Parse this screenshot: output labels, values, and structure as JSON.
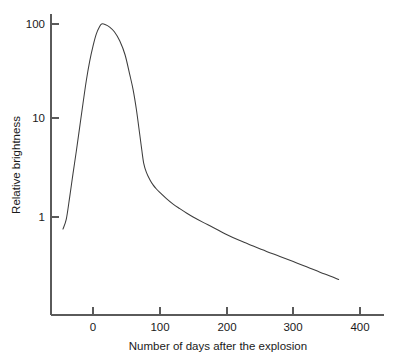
{
  "chart_data": {
    "type": "line",
    "title": "",
    "xlabel": "Number of days after the explosion",
    "ylabel": "Relative brightness",
    "xscale": "linear",
    "yscale": "log",
    "xlim": [
      -55,
      435
    ],
    "ylim": [
      0.17,
      180
    ],
    "grid": false,
    "legend": false,
    "xticks": [
      0,
      100,
      200,
      300,
      400
    ],
    "xticklabels": [
      "0",
      "100",
      "200",
      "300",
      "400"
    ],
    "yticks": [
      1,
      10,
      100
    ],
    "yticklabels": [
      "1",
      "10",
      "100"
    ],
    "series": [
      {
        "name": "Supernova light curve",
        "x": [
          -45,
          -40,
          -35,
          -30,
          -25,
          -20,
          -15,
          -10,
          -5,
          0,
          5,
          10,
          13,
          18,
          25,
          32,
          40,
          48,
          55,
          60,
          65,
          70,
          73,
          76,
          80,
          85,
          90,
          95,
          100,
          110,
          120,
          130,
          140,
          150,
          165,
          180,
          200,
          220,
          240,
          260,
          280,
          300,
          320,
          340,
          355,
          368
        ],
        "y": [
          0.75,
          0.95,
          1.6,
          2.8,
          4.8,
          8.5,
          15.0,
          26.0,
          41.0,
          59.0,
          79.0,
          94.0,
          100.0,
          99.0,
          93.0,
          83.0,
          67.0,
          48.0,
          30.0,
          21.0,
          13.0,
          7.2,
          5.0,
          3.6,
          2.9,
          2.45,
          2.15,
          1.95,
          1.8,
          1.55,
          1.36,
          1.22,
          1.1,
          1.0,
          0.88,
          0.78,
          0.66,
          0.57,
          0.5,
          0.44,
          0.39,
          0.345,
          0.305,
          0.268,
          0.245,
          0.225
        ]
      }
    ],
    "annotations": {
      "peak_day": 13,
      "peak_brightness": 100,
      "shoulder_day": 73,
      "shoulder_brightness": 5,
      "curve_start_day": -45,
      "curve_start_brightness": 0.75,
      "curve_end_day": 368,
      "curve_end_brightness": 0.225
    },
    "colors": {
      "curve": "#3d3d3d",
      "axis": "#5a5a5a",
      "text": "#1a1a1a",
      "background": "#ffffff"
    }
  }
}
